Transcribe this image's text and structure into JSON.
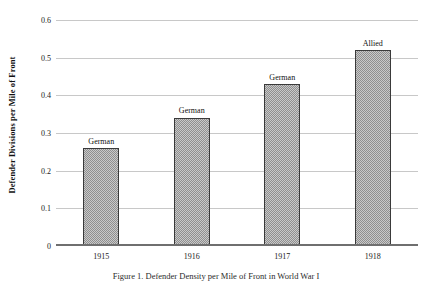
{
  "chart_data": {
    "type": "bar",
    "title": "",
    "categories": [
      "1915",
      "1916",
      "1917",
      "1918"
    ],
    "values": [
      0.26,
      0.34,
      0.43,
      0.52
    ],
    "point_labels": [
      "German",
      "German",
      "German",
      "Allied"
    ],
    "xlabel": "",
    "ylabel": "Defender Divisions per Mile of Front",
    "ylim": [
      0,
      0.6
    ],
    "yticks": [
      0,
      0.1,
      0.2,
      0.3,
      0.4,
      0.5,
      0.6
    ],
    "ytick_labels": [
      "0",
      "0.1",
      "0.2",
      "0.3",
      "0.4",
      "0.5",
      "0.6"
    ],
    "grid": true,
    "legend": "none",
    "bar_fill_color": "#c9c9c9",
    "bar_hatch_color": "#8f8f8f",
    "bar_edge_color": "#3a3a3a",
    "gridline_color": "#c8c8c8",
    "axis_color": "#6f6f6f"
  },
  "caption": {
    "text": "Figure 1. Defender Density per Mile of Front in World War I"
  }
}
